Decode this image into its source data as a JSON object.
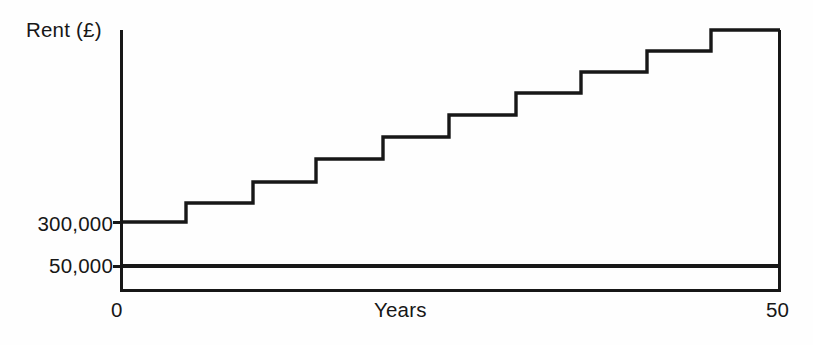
{
  "figure": {
    "background_color": "#fefefe",
    "ink_color": "#171717"
  },
  "axes": {
    "y_axis_title": "Rent (£)",
    "x_axis_title": "Years",
    "y_tick_labels": [
      "300,000",
      "50,000"
    ],
    "x_tick_labels": [
      "0",
      "50"
    ]
  },
  "chart_data": {
    "type": "line",
    "title": "",
    "subtitle": "",
    "xlabel": "Years",
    "ylabel": "Rent (£)",
    "xlim": [
      0,
      50
    ],
    "ylim": [
      0,
      950000
    ],
    "grid": false,
    "legend": null,
    "x_ticks": [
      0,
      50
    ],
    "x_tick_labels": [
      "0",
      "50"
    ],
    "y_ticks": [
      50000,
      300000
    ],
    "y_tick_labels": [
      "50,000",
      "300,000"
    ],
    "annotations": [],
    "series": [
      {
        "name": "Reviewed rent (stepped)",
        "style": "step-post",
        "line_width": 3,
        "color": "#171717",
        "x": [
          0,
          5,
          10,
          15,
          20,
          25,
          30,
          35,
          40,
          45,
          50
        ],
        "values": [
          300000,
          340000,
          385000,
          435000,
          482000,
          529000,
          576000,
          621000,
          666000,
          710000,
          710000
        ],
        "step_pixel_x": [
          121,
          186,
          253,
          316,
          383,
          449,
          516,
          581,
          647,
          711,
          780
        ],
        "step_pixel_y": [
          222,
          203,
          182,
          159,
          137,
          115,
          93,
          72,
          51,
          30,
          30
        ]
      },
      {
        "name": "Fixed rent",
        "style": "line",
        "line_width": 3,
        "color": "#171717",
        "x": [
          0,
          50
        ],
        "values": [
          50000,
          50000
        ],
        "pixel_y": 266
      }
    ]
  },
  "geometry": {
    "y_axis_x": 121,
    "x_axis_y": 290,
    "plot_right_x": 780,
    "plot_top_y": 30
  }
}
